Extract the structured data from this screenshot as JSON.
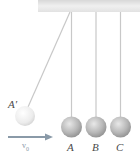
{
  "diagram": {
    "title": "",
    "balls": [
      {
        "id": "A-prime",
        "label": "A′",
        "cx": 25,
        "cy": 116,
        "r": 10
      },
      {
        "id": "A",
        "label": "A",
        "cx": 71.5,
        "cy": 127,
        "r": 10.5
      },
      {
        "id": "B",
        "label": "B",
        "cx": 96,
        "cy": 127,
        "r": 10.5
      },
      {
        "id": "C",
        "label": "C",
        "cx": 120.5,
        "cy": 127,
        "r": 10.5
      }
    ],
    "velocity": {
      "label": "v",
      "subscript": "0"
    },
    "colors": {
      "ceiling": "#e6e6e6",
      "string": "#c8c8c8",
      "ball_light": "#f2f2f2",
      "ball_dark": "#9a9a9a",
      "arrow": "#8a9aa8",
      "label": "#4a4a4a"
    }
  }
}
